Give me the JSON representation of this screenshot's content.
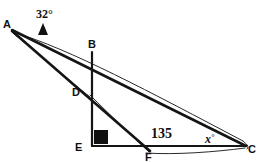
{
  "figure": {
    "background_color": "#ffffff",
    "line_color": "#151515",
    "width": 270,
    "height": 162
  },
  "vertices": [
    {
      "name": "A",
      "label": "A",
      "x": 12,
      "y": 30,
      "label_x": 6,
      "label_y": 28
    },
    {
      "name": "B",
      "label": "B",
      "x": 92,
      "y": 52,
      "label_x": 88,
      "label_y": 47
    },
    {
      "name": "D",
      "label": "D",
      "x": 89,
      "y": 92,
      "label_x": 74,
      "label_y": 95
    },
    {
      "name": "E",
      "label": "E",
      "x": 92,
      "y": 145,
      "label_x": 77,
      "label_y": 150
    },
    {
      "name": "F",
      "label": "F",
      "x": 150,
      "y": 150,
      "label_x": 147,
      "label_y": 160
    },
    {
      "name": "C",
      "label": "C",
      "x": 246,
      "y": 146,
      "label_x": 248,
      "label_y": 152
    }
  ],
  "segments": [
    {
      "name": "segment-a-to-c",
      "from": "A",
      "to": "C",
      "style": "main"
    },
    {
      "name": "segment-a-to-f",
      "from": "A",
      "to": "F",
      "style": "main"
    },
    {
      "name": "segment-b-to-e",
      "from": "B",
      "to": "E",
      "style": "axis"
    },
    {
      "name": "segment-e-to-c",
      "from": "E",
      "to": "C",
      "style": "axis"
    }
  ],
  "annotations": {
    "angle_at_a": {
      "name": "angle-32-degrees",
      "text": "32°",
      "value": 32,
      "unit": "degrees",
      "x": 47,
      "y": 16,
      "arrow": "up-triangle",
      "arrow_x": 43,
      "arrow_y": 24
    },
    "angle_at_f": {
      "name": "angle-135",
      "text": "135",
      "value": 135,
      "unit": "degrees",
      "x": 153,
      "y": 136
    },
    "angle_at_c": {
      "name": "angle-x-degrees",
      "text": "x",
      "degree_symbol": "°",
      "value": null,
      "unit": "degrees",
      "x": 207,
      "y": 142
    },
    "right_angle_at_e": {
      "name": "right-angle-marker-e",
      "value": 90,
      "unit": "degrees",
      "x": 94,
      "y": 128,
      "size": 13
    }
  }
}
